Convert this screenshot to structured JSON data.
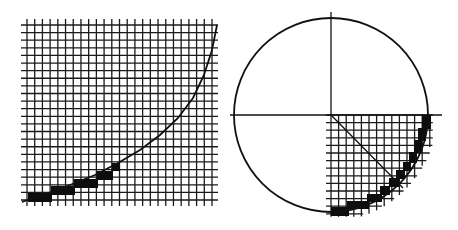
{
  "figure": {
    "left_panel": {
      "name": "exponential-curve-raster",
      "grid": {
        "x0": 27,
        "x1": 212,
        "y0": 25,
        "y1": 200,
        "cols": 24,
        "rows": 23,
        "overshoot": 6
      },
      "curve_points": [
        [
          22,
          202
        ],
        [
          60,
          189
        ],
        [
          95,
          175
        ],
        [
          118,
          163
        ],
        [
          140,
          150
        ],
        [
          160,
          135
        ],
        [
          178,
          118
        ],
        [
          193,
          98
        ],
        [
          204,
          75
        ],
        [
          212,
          50
        ],
        [
          217,
          25
        ]
      ],
      "staircase_blocks": [
        {
          "x": 28,
          "y": 193,
          "w": 24,
          "h": 9
        },
        {
          "x": 51,
          "y": 186,
          "w": 24,
          "h": 9
        },
        {
          "x": 74,
          "y": 179,
          "w": 24,
          "h": 9
        },
        {
          "x": 97,
          "y": 171,
          "w": 16,
          "h": 9
        },
        {
          "x": 112,
          "y": 163,
          "w": 8,
          "h": 8
        }
      ],
      "colors": {
        "line": "#1a1a1a",
        "fill": "#0d0d0d"
      }
    },
    "right_panel": {
      "name": "circle-quadrant-raster",
      "circle": {
        "cx": 331,
        "cy": 115,
        "r": 97
      },
      "axes": {
        "h": {
          "x1": 230,
          "x2": 442,
          "y": 115
        },
        "v": {
          "x": 331,
          "y1": 12,
          "y2": 115
        }
      },
      "radius_line": {
        "x1": 331,
        "y1": 115,
        "x2": 403,
        "y2": 188
      },
      "grid": {
        "x0": 331,
        "y0": 115,
        "step": 7.6,
        "cols": 13,
        "rows": 13
      },
      "staircase_blocks": [
        {
          "x": 331,
          "y": 207,
          "w": 18,
          "h": 9
        },
        {
          "x": 347,
          "y": 201,
          "w": 22,
          "h": 8
        },
        {
          "x": 367,
          "y": 194,
          "w": 15,
          "h": 8
        },
        {
          "x": 380,
          "y": 186,
          "w": 10,
          "h": 9
        },
        {
          "x": 389,
          "y": 178,
          "w": 10,
          "h": 9
        },
        {
          "x": 396,
          "y": 170,
          "w": 9,
          "h": 9
        },
        {
          "x": 403,
          "y": 162,
          "w": 8,
          "h": 9
        },
        {
          "x": 409,
          "y": 152,
          "w": 8,
          "h": 11
        },
        {
          "x": 414,
          "y": 140,
          "w": 8,
          "h": 13
        },
        {
          "x": 418,
          "y": 128,
          "w": 8,
          "h": 13
        },
        {
          "x": 422,
          "y": 115,
          "w": 9,
          "h": 14
        }
      ]
    }
  }
}
